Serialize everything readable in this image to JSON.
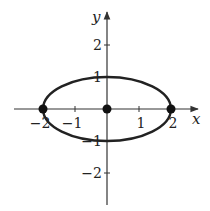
{
  "chart_data": {
    "type": "line",
    "title": "",
    "xlabel": "x",
    "ylabel": "y",
    "xlim": [
      -2.8,
      2.8
    ],
    "ylim": [
      -3.0,
      3.0
    ],
    "grid": false,
    "x_ticks": [
      {
        "value": -2,
        "label": "−2"
      },
      {
        "value": -1,
        "label": "−1"
      },
      {
        "value": 1,
        "label": "1"
      },
      {
        "value": 2,
        "label": "2"
      }
    ],
    "y_ticks": [
      {
        "value": 2,
        "label": "2"
      },
      {
        "value": 1,
        "label": "1"
      },
      {
        "value": -1,
        "label": "−1"
      },
      {
        "value": -2,
        "label": "−2"
      }
    ],
    "series": [
      {
        "name": "ellipse",
        "kind": "ellipse",
        "center": [
          0,
          0
        ],
        "semi_axis_x": 2,
        "semi_axis_y": 1,
        "equation": "x^2/4 + y^2 = 1"
      }
    ],
    "points": [
      {
        "x": -2,
        "y": 0
      },
      {
        "x": 0,
        "y": 0
      },
      {
        "x": 2,
        "y": 0
      }
    ]
  },
  "colors": {
    "axis": "#333333",
    "curve": "#222222",
    "point": "#111111"
  }
}
